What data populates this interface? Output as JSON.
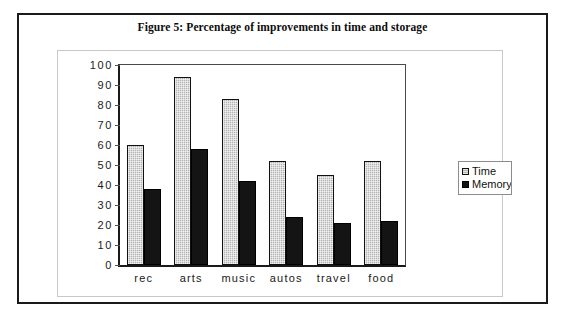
{
  "figure": {
    "caption": "Figure 5: Percentage of improvements in time and storage"
  },
  "legend": {
    "position": "right",
    "items": [
      {
        "label": "Time",
        "swatch": "light-gray-hatched",
        "color": "#b3b3b3"
      },
      {
        "label": "Memory",
        "swatch": "black",
        "color": "#141414"
      }
    ]
  },
  "axis": {
    "y_ticks": [
      "100",
      "90",
      "80",
      "70",
      "60",
      "50",
      "40",
      "30",
      "20",
      "10",
      "0"
    ]
  },
  "chart_data": {
    "type": "bar",
    "title": "Figure 5: Percentage of improvements in time and storage",
    "xlabel": "",
    "ylabel": "",
    "ylim": [
      0,
      100
    ],
    "ytick_step": 10,
    "grid": false,
    "legend_position": "right",
    "categories": [
      "rec",
      "arts",
      "music",
      "autos",
      "travel",
      "food"
    ],
    "series": [
      {
        "name": "Time",
        "color": "#b3b3b3",
        "values": [
          60,
          94,
          83,
          52,
          45,
          52
        ]
      },
      {
        "name": "Memory",
        "color": "#141414",
        "values": [
          38,
          58,
          42,
          24,
          21,
          22
        ]
      }
    ]
  }
}
